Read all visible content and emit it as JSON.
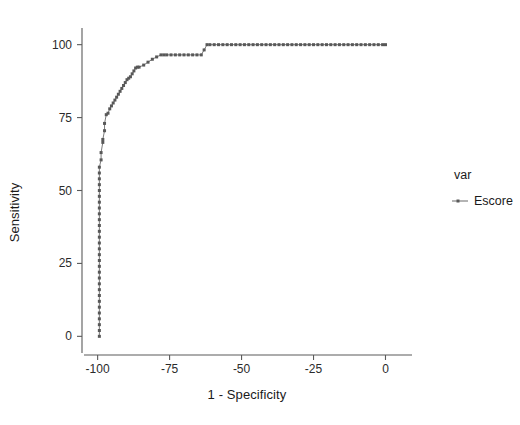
{
  "chart_data": {
    "type": "line",
    "title": "",
    "xlabel": "1 - Specificity",
    "ylabel": "Sensitivity",
    "xlim": [
      -103,
      4
    ],
    "ylim": [
      -4,
      104
    ],
    "xticks": [
      -100,
      -75,
      -50,
      -25,
      0
    ],
    "xtick_labels": [
      "-100",
      "-75",
      "-50",
      "-25",
      "0"
    ],
    "yticks": [
      0,
      25,
      50,
      75,
      100
    ],
    "ytick_labels": [
      "0",
      "25",
      "50",
      "75",
      "100"
    ],
    "grid": false,
    "legend_position": "right",
    "legend_title": "var",
    "series": [
      {
        "name": "Escore",
        "color": "#6b6b6b",
        "marker": "square",
        "x": [
          -99.4,
          -99.4,
          -99.4,
          -99.4,
          -99.4,
          -99.4,
          -99.4,
          -99.4,
          -99.4,
          -99.4,
          -99.4,
          -99.4,
          -99.4,
          -99.4,
          -99.4,
          -99.4,
          -99.4,
          -99.4,
          -99.4,
          -99.4,
          -99.4,
          -99.4,
          -99.4,
          -99.4,
          -99.4,
          -99.4,
          -99.4,
          -99.4,
          -99.4,
          -99.4,
          -98.8,
          -98.8,
          -98.2,
          -98.2,
          -97.6,
          -97.6,
          -97.0,
          -96.4,
          -95.8,
          -95.2,
          -94.6,
          -94.0,
          -93.4,
          -92.8,
          -92.2,
          -91.6,
          -91.0,
          -90.4,
          -89.8,
          -89.2,
          -88.6,
          -88.0,
          -87.4,
          -86.8,
          -86.2,
          -85.6,
          -84.0,
          -82.5,
          -81.0,
          -79.5,
          -78.0,
          -77.0,
          -76.0,
          -74.5,
          -73.0,
          -71.5,
          -70.0,
          -68.5,
          -67.0,
          -65.5,
          -64.0,
          -63.0,
          -62.0,
          -61.0,
          -59.5,
          -58.0,
          -56.5,
          -55.0,
          -53.5,
          -52.0,
          -50.5,
          -49.0,
          -47.5,
          -46.0,
          -44.5,
          -43.0,
          -41.5,
          -40.0,
          -38.5,
          -37.0,
          -35.5,
          -34.0,
          -32.5,
          -31.0,
          -29.5,
          -28.0,
          -26.5,
          -25.0,
          -23.5,
          -22.0,
          -20.5,
          -19.0,
          -17.5,
          -16.0,
          -14.5,
          -13.0,
          -11.5,
          -10.0,
          -8.5,
          -7.0,
          -5.5,
          -4.0,
          -2.5,
          -1.0,
          0.0
        ],
        "y": [
          0.0,
          2.0,
          4.0,
          6.0,
          8.0,
          10.0,
          12.0,
          14.0,
          16.0,
          18.0,
          20.0,
          22.0,
          24.0,
          26.0,
          28.0,
          30.0,
          32.0,
          34.0,
          36.0,
          38.0,
          40.0,
          42.0,
          44.0,
          46.0,
          48.0,
          50.0,
          52.0,
          54.0,
          56.0,
          58.0,
          60.5,
          63.0,
          66.5,
          67.5,
          70.5,
          73.0,
          76.0,
          76.5,
          78.0,
          79.0,
          80.0,
          81.0,
          82.0,
          83.0,
          84.0,
          85.0,
          86.0,
          87.0,
          88.0,
          88.5,
          89.0,
          90.0,
          91.0,
          92.0,
          92.3,
          92.3,
          93.0,
          94.0,
          95.0,
          95.8,
          96.5,
          96.5,
          96.5,
          96.5,
          96.5,
          96.5,
          96.5,
          96.5,
          96.5,
          96.5,
          96.5,
          98.2,
          100.0,
          100.0,
          100.0,
          100.0,
          100.0,
          100.0,
          100.0,
          100.0,
          100.0,
          100.0,
          100.0,
          100.0,
          100.0,
          100.0,
          100.0,
          100.0,
          100.0,
          100.0,
          100.0,
          100.0,
          100.0,
          100.0,
          100.0,
          100.0,
          100.0,
          100.0,
          100.0,
          100.0,
          100.0,
          100.0,
          100.0,
          100.0,
          100.0,
          100.0,
          100.0,
          100.0,
          100.0,
          100.0,
          100.0,
          100.0,
          100.0,
          100.0,
          100.0
        ]
      }
    ]
  },
  "legend": {
    "title": "var",
    "entries": [
      {
        "label": "Escore"
      }
    ]
  },
  "colors": {
    "series": "#6b6b6b",
    "axis": "#5a5a5a",
    "text": "#1a1a1a",
    "background": "#ffffff"
  }
}
